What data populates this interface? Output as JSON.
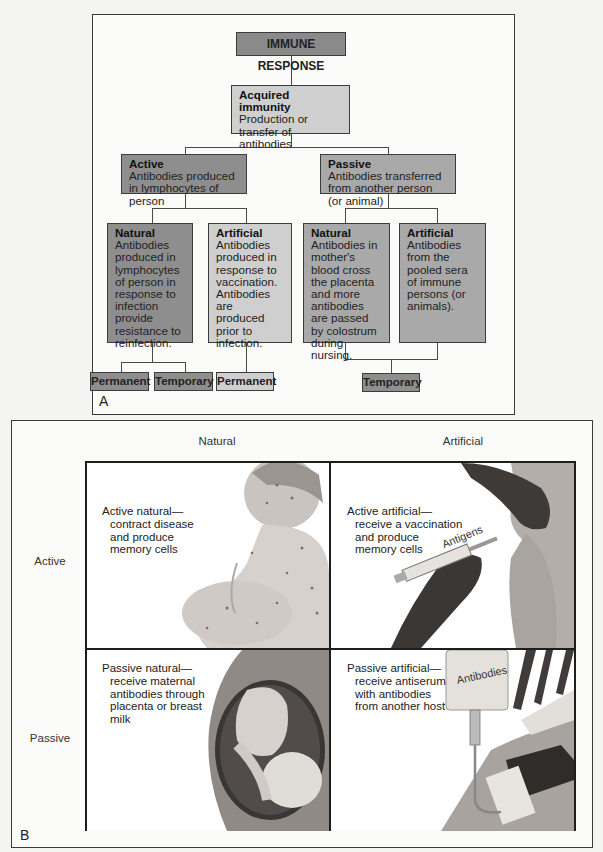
{
  "panel_a": {
    "label": "A",
    "root": {
      "title": "IMMUNE RESPONSE"
    },
    "acquired": {
      "heading": "Acquired immunity",
      "text": "Production or transfer of antibodies"
    },
    "active": {
      "heading": "Active",
      "text": "Antibodies produced in lymphocytes of person"
    },
    "passive": {
      "heading": "Passive",
      "text": "Antibodies transferred from another person (or animal)"
    },
    "active_natural": {
      "heading": "Natural",
      "text": "Antibodies produced in lymphocytes of person in response to infection provide resistance to reinfection."
    },
    "active_artificial": {
      "heading": "Artificial",
      "text": "Antibodies produced in response to vaccination. Antibodies are produced prior to infection."
    },
    "passive_natural": {
      "heading": "Natural",
      "text": "Antibodies in mother's blood cross the placenta and more antibodies are passed by colostrum during nursing."
    },
    "passive_artificial": {
      "heading": "Artificial",
      "text": "Antibodies from the pooled sera of immune persons (or animals)."
    },
    "outcomes": {
      "active_natural_1": "Permanent",
      "active_natural_2": "Temporary",
      "active_artificial": "Permanent",
      "passive": "Temporary"
    }
  },
  "panel_b": {
    "label": "B",
    "columns": [
      "Natural",
      "Artificial"
    ],
    "rows": [
      "Active",
      "Passive"
    ],
    "cells": {
      "active_natural": {
        "title": "Active natural—",
        "lines": [
          "contract disease",
          "and produce",
          "memory cells"
        ]
      },
      "active_artificial": {
        "title": "Active artificial—",
        "lines": [
          "receive a vaccination",
          "and produce",
          "memory cells"
        ],
        "illustration_label": "Antigens"
      },
      "passive_natural": {
        "title": "Passive natural—",
        "lines": [
          "receive maternal",
          "antibodies through",
          "placenta or breast",
          "milk"
        ]
      },
      "passive_artificial": {
        "title": "Passive artificial—",
        "lines": [
          "receive antiserum",
          "with antibodies",
          "from another host"
        ],
        "illustration_label": "Antibodies"
      }
    }
  },
  "colors": {
    "dark_box": "#8e8e8e",
    "mid_box": "#a9a9a9",
    "light_box": "#cfcfcf",
    "border": "#3a3a3a"
  }
}
